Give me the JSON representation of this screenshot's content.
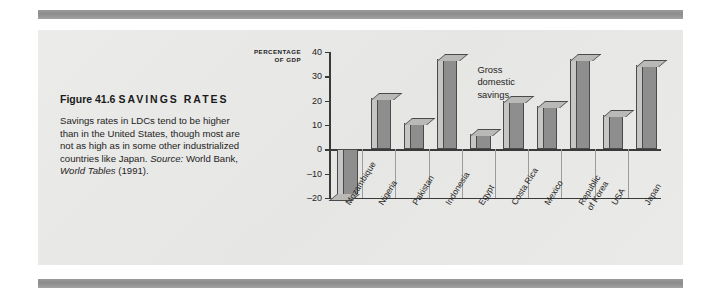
{
  "page": {
    "background_color": "#ffffff",
    "rule_color": "#8c8c8c",
    "panel_color": "#e9e9e7"
  },
  "caption": {
    "figure_number": "Figure 41.6",
    "figure_name": "SAVINGS RATES",
    "body": "Savings rates in LDCs tend to be higher than in the United States, though most are not as high as in some other industrialized countries like Japan.",
    "source_label": "Source:",
    "source_text": "World Bank,",
    "source_title": "World Tables",
    "source_year": "(1991)."
  },
  "chart_data": {
    "type": "bar",
    "title": "",
    "xlabel": "",
    "ylabel": "PERCENTAGE OF GDP",
    "ylabel_line1": "PERCENTAGE",
    "ylabel_line2": "OF GDP",
    "ylim": [
      -20,
      40
    ],
    "yticks": [
      40,
      30,
      20,
      10,
      0,
      -10,
      -20
    ],
    "ytick_labels": [
      "40",
      "30",
      "20",
      "10",
      "0",
      "–10",
      "–20"
    ],
    "grid": false,
    "legend": "none",
    "annotation": "Gross domestic savings",
    "annotation_lines": [
      "Gross",
      "domestic",
      "savings"
    ],
    "series_name": "Gross domestic savings",
    "categories": [
      "Mozambique",
      "Nigeria",
      "Pakistan",
      "Indonesia",
      "Egypt",
      "Costa Rica",
      "Mexico",
      "Republic of Korea",
      "USA",
      "Japan"
    ],
    "category_lines": [
      [
        "Mozambique"
      ],
      [
        "Nigeria"
      ],
      [
        "Pakistan"
      ],
      [
        "Indonesia"
      ],
      [
        "Egypt"
      ],
      [
        "Costa Rica"
      ],
      [
        "Mexico"
      ],
      [
        "Republic",
        "of Korea"
      ],
      [
        "USA"
      ],
      [
        "Japan"
      ]
    ],
    "values": [
      -19,
      21,
      11,
      37,
      6.5,
      20,
      18,
      37,
      14,
      34.5
    ],
    "bar_fill_color": "#8e8e8e",
    "bar_top_color": "#b9b9b7",
    "bar_side_color": "#c6c6c4",
    "bar_outline_color": "#4a4a4a",
    "axis_color": "#3a3a3a"
  }
}
